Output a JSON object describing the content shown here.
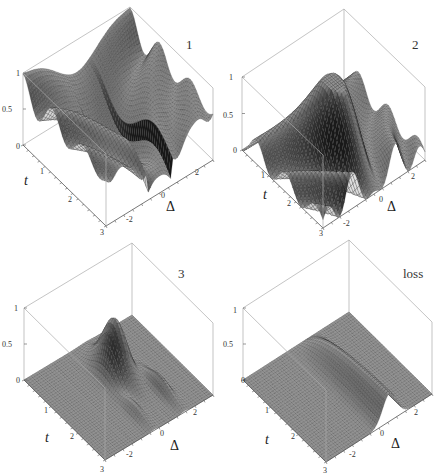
{
  "chart_data": [
    {
      "type": "surface3d",
      "panel_label": "1",
      "xlabel": "t",
      "ylabel": "Δ",
      "zlabel": "",
      "x_ticks": [
        "0",
        "1",
        "2",
        "3"
      ],
      "y_ticks": [
        "-2",
        "0",
        "2"
      ],
      "z_ticks": [
        "0",
        "0.5",
        "1"
      ],
      "xlim": [
        0,
        3
      ],
      "ylim": [
        -3,
        3
      ],
      "zlim": [
        0,
        1
      ],
      "description": "Starts at 1 for t=0 across all Δ; decays with t, with oscillating ripples along Δ (Rabi-like fringes), minima near Δ≈0 at t≈2-3",
      "samples": [
        {
          "t": 0,
          "delta": 0,
          "z": 1.0
        },
        {
          "t": 1,
          "delta": 0,
          "z": 0.35
        },
        {
          "t": 2,
          "delta": 0,
          "z": 0.1
        },
        {
          "t": 3,
          "delta": 0,
          "z": 0.3
        },
        {
          "t": 1,
          "delta": 2,
          "z": 0.75
        },
        {
          "t": 2,
          "delta": -2,
          "z": 0.55
        }
      ]
    },
    {
      "type": "surface3d",
      "panel_label": "2",
      "xlabel": "t",
      "ylabel": "Δ",
      "x_ticks": [
        "0",
        "1",
        "2",
        "3"
      ],
      "y_ticks": [
        "-2",
        "0",
        "2"
      ],
      "z_ticks": [
        "0",
        "0.5",
        "1"
      ],
      "xlim": [
        0,
        3
      ],
      "ylim": [
        -3,
        3
      ],
      "zlim": [
        0,
        1
      ],
      "description": "Starts at 0 for t=0; rises to a maximum ~0.7 near Δ≈0, t≈1; oscillating ripples along Δ",
      "samples": [
        {
          "t": 0,
          "delta": 0,
          "z": 0.0
        },
        {
          "t": 1,
          "delta": 0,
          "z": 0.7
        },
        {
          "t": 2,
          "delta": 0,
          "z": 0.45
        },
        {
          "t": 3,
          "delta": 0,
          "z": 0.3
        },
        {
          "t": 1.5,
          "delta": 2,
          "z": 0.35
        }
      ]
    },
    {
      "type": "surface3d",
      "panel_label": "3",
      "xlabel": "t",
      "ylabel": "Δ",
      "x_ticks": [
        "0",
        "1",
        "2",
        "3"
      ],
      "y_ticks": [
        "-2",
        "0",
        "2"
      ],
      "z_ticks": [
        "0",
        "0.5",
        "1"
      ],
      "xlim": [
        0,
        3
      ],
      "ylim": [
        -3,
        3
      ],
      "zlim": [
        0,
        1
      ],
      "description": "Flat near 0 except a localized peak ~0.75 around Δ≈0.5, t≈1.2 with smaller side ridges",
      "samples": [
        {
          "t": 0,
          "delta": 0,
          "z": 0.0
        },
        {
          "t": 1.2,
          "delta": 0.5,
          "z": 0.75
        },
        {
          "t": 2.5,
          "delta": 0,
          "z": 0.15
        },
        {
          "t": 2,
          "delta": 1.5,
          "z": 0.2
        }
      ]
    },
    {
      "type": "surface3d",
      "panel_label": "loss",
      "xlabel": "t",
      "ylabel": "Δ",
      "x_ticks": [
        "0",
        "1",
        "2",
        "3"
      ],
      "y_ticks": [
        "-2",
        "0",
        "2"
      ],
      "z_ticks": [
        "0",
        "0.5",
        "1"
      ],
      "xlim": [
        0,
        3
      ],
      "ylim": [
        -3,
        3
      ],
      "zlim": [
        0,
        1
      ],
      "description": "Flat at 0 except a ridge centered at Δ≈0.5 growing with t up to ~0.4",
      "samples": [
        {
          "t": 0,
          "delta": 0.5,
          "z": 0.0
        },
        {
          "t": 1.5,
          "delta": 0.5,
          "z": 0.3
        },
        {
          "t": 3,
          "delta": 0.5,
          "z": 0.4
        }
      ]
    }
  ],
  "panels": [
    {
      "id": "1",
      "axis_t": "t",
      "axis_delta": "Δ"
    },
    {
      "id": "2",
      "axis_t": "t",
      "axis_delta": "Δ"
    },
    {
      "id": "3",
      "axis_t": "t",
      "axis_delta": "Δ"
    },
    {
      "id": "loss",
      "axis_t": "t",
      "axis_delta": "Δ"
    }
  ],
  "ticks": {
    "t": [
      "0",
      "1",
      "2",
      "3"
    ],
    "delta": [
      "-2",
      "0",
      "2"
    ],
    "z": [
      "0",
      "0.5",
      "1"
    ]
  },
  "colors": {
    "mesh_line": "#1a1a1a",
    "surface_light": "#eeeeee",
    "surface_dark": "#2a2a2a",
    "box": "#aaaaaa"
  }
}
